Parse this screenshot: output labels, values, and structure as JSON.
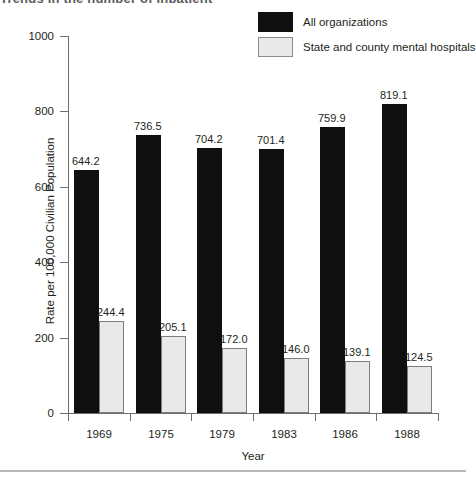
{
  "top_cropped_text": "Trends in the number of inpatient",
  "legend": {
    "position": "top-right",
    "items": [
      {
        "label": "All organizations",
        "color": "#100f10",
        "swatch": "black-swatch"
      },
      {
        "label": "State and county mental hospitals",
        "color": "#e9e9e9",
        "swatch": "grey-swatch"
      }
    ]
  },
  "chart_data": {
    "type": "bar",
    "title": "",
    "xlabel": "Year",
    "ylabel": "Rate per 100,000 Civilian Population",
    "categories": [
      "1969",
      "1975",
      "1979",
      "1983",
      "1986",
      "1988"
    ],
    "ylim": [
      0,
      1000
    ],
    "yticks": [
      0,
      200,
      400,
      600,
      800,
      1000
    ],
    "ytick_labels": [
      "0",
      "200",
      "400",
      "600",
      "800",
      "1000"
    ],
    "grid": false,
    "legend_position": "top-right",
    "series": [
      {
        "name": "All organizations",
        "color": "#100f10",
        "values": [
          644.2,
          736.5,
          704.2,
          701.4,
          759.9,
          819.1
        ],
        "labels": [
          "644.2",
          "736.5",
          "704.2",
          "701.4",
          "759.9",
          "819.1"
        ]
      },
      {
        "name": "State and county mental hospitals",
        "color": "#e9e9e9",
        "values": [
          244.4,
          205.1,
          172.0,
          146.0,
          139.1,
          124.5
        ],
        "labels": [
          "244.4",
          "205.1",
          "172.0",
          "146.0",
          "139.1",
          "124.5"
        ]
      }
    ]
  }
}
